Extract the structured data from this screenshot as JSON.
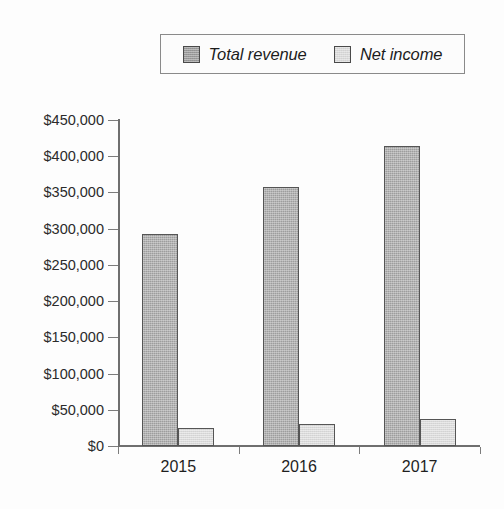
{
  "chart_data": {
    "type": "bar",
    "title": "",
    "xlabel": "",
    "ylabel": "",
    "categories": [
      "2015",
      "2016",
      "2017"
    ],
    "series": [
      {
        "name": "Total revenue",
        "values": [
          293000,
          358000,
          414000
        ],
        "color": "#9d9d9d"
      },
      {
        "name": "Net income",
        "values": [
          25000,
          30000,
          37000
        ],
        "color": "#dadada"
      }
    ],
    "ylim": [
      0,
      450000
    ],
    "ytick_values": [
      0,
      50000,
      100000,
      150000,
      200000,
      250000,
      300000,
      350000,
      400000,
      450000
    ],
    "ytick_labels": [
      "$0",
      "$50,000",
      "$100,000",
      "$150,000",
      "$200,000",
      "$250,000",
      "$300,000",
      "$350,000",
      "$400,000",
      "$450,000"
    ],
    "grid": false,
    "legend_position": "top-center",
    "legend_entries": [
      "Total revenue",
      "Net income"
    ]
  },
  "legend": {
    "items": [
      {
        "label": "Total revenue",
        "swatch": "revenue-swatch-icon"
      },
      {
        "label": "Net income",
        "swatch": "net-income-swatch-icon"
      }
    ]
  },
  "colors": {
    "revenue_fill": "#9d9d9d",
    "income_fill": "#dadada",
    "bar_border": "#555555",
    "axis": "#6f6f6f",
    "text": "#1f1f1f",
    "background": "#fdfdfd"
  }
}
